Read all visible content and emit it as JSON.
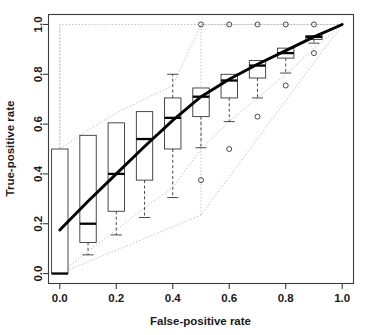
{
  "chart_data": {
    "type": "boxplot",
    "title": "",
    "xlabel": "False-positive rate",
    "ylabel": "True-positive rate",
    "xlim": [
      -0.04,
      1.04
    ],
    "ylim": [
      -0.04,
      1.04
    ],
    "xticks": [
      0.0,
      0.2,
      0.4,
      0.6,
      0.8,
      1.0
    ],
    "xticklabels": [
      "0.0",
      "0.2",
      "0.4",
      "0.6",
      "0.8",
      "1.0"
    ],
    "yticks": [
      0.0,
      0.2,
      0.4,
      0.6,
      0.8,
      1.0
    ],
    "yticklabels": [
      "0.0",
      "0.2",
      "0.4",
      "0.6",
      "0.8",
      "1.0"
    ],
    "grid": false,
    "legend": "none",
    "box_width": 0.058,
    "boxes": [
      {
        "x": 0.0,
        "lower_whisker": 0.0,
        "q1": 0.0,
        "median": 0.0,
        "q3": 0.5,
        "upper_whisker": 0.5,
        "outliers": []
      },
      {
        "x": 0.1,
        "lower_whisker": 0.075,
        "q1": 0.125,
        "median": 0.2,
        "q3": 0.555,
        "upper_whisker": 0.555,
        "outliers": []
      },
      {
        "x": 0.2,
        "lower_whisker": 0.155,
        "q1": 0.25,
        "median": 0.4,
        "q3": 0.605,
        "upper_whisker": 0.605,
        "outliers": []
      },
      {
        "x": 0.3,
        "lower_whisker": 0.225,
        "q1": 0.375,
        "median": 0.54,
        "q3": 0.65,
        "upper_whisker": 0.65,
        "outliers": []
      },
      {
        "x": 0.4,
        "lower_whisker": 0.305,
        "q1": 0.5,
        "median": 0.625,
        "q3": 0.705,
        "upper_whisker": 0.8,
        "outliers": []
      },
      {
        "x": 0.5,
        "lower_whisker": 0.505,
        "q1": 0.63,
        "median": 0.71,
        "q3": 0.745,
        "upper_whisker": 0.745,
        "outliers": [
          0.375,
          1.0
        ]
      },
      {
        "x": 0.6,
        "lower_whisker": 0.61,
        "q1": 0.705,
        "median": 0.775,
        "q3": 0.8,
        "upper_whisker": 0.8,
        "outliers": [
          0.5,
          1.0
        ]
      },
      {
        "x": 0.7,
        "lower_whisker": 0.705,
        "q1": 0.785,
        "median": 0.835,
        "q3": 0.855,
        "upper_whisker": 0.855,
        "outliers": [
          0.63,
          1.0
        ]
      },
      {
        "x": 0.8,
        "lower_whisker": 0.805,
        "q1": 0.865,
        "median": 0.885,
        "q3": 0.905,
        "upper_whisker": 0.905,
        "outliers": [
          0.755,
          1.0
        ]
      },
      {
        "x": 0.9,
        "lower_whisker": 0.925,
        "q1": 0.94,
        "median": 0.95,
        "q3": 0.955,
        "upper_whisker": 0.955,
        "outliers": [
          0.885,
          1.0
        ]
      }
    ],
    "roc_curve": {
      "name": "mean ROC curve",
      "x": [
        0.0,
        0.1,
        0.2,
        0.3,
        0.4,
        0.5,
        0.6,
        0.7,
        0.8,
        0.9,
        1.0
      ],
      "y": [
        0.175,
        0.29,
        0.4,
        0.51,
        0.615,
        0.71,
        0.78,
        0.84,
        0.895,
        0.95,
        1.0
      ]
    },
    "bands": [
      {
        "name": "upper-envelope",
        "x": [
          0.0,
          0.0,
          0.5,
          1.0
        ],
        "y": [
          0.175,
          1.0,
          1.0,
          1.0
        ]
      },
      {
        "name": "upper-inner-envelope",
        "x": [
          0.0,
          0.1,
          0.2,
          0.3,
          0.4,
          0.5,
          0.6,
          0.7,
          0.8,
          0.9,
          1.0
        ],
        "y": [
          0.5,
          0.575,
          0.645,
          0.7,
          0.755,
          1.0,
          1.0,
          1.0,
          1.0,
          1.0,
          1.0
        ]
      },
      {
        "name": "lower-inner-envelope",
        "x": [
          0.0,
          0.1,
          0.2,
          0.3,
          0.4,
          0.5,
          0.6,
          0.7,
          0.8,
          0.9,
          1.0
        ],
        "y": [
          0.0,
          0.09,
          0.175,
          0.265,
          0.345,
          0.5,
          0.61,
          0.705,
          0.8,
          0.905,
          1.0
        ]
      },
      {
        "name": "lower-outer-envelope",
        "x": [
          0.0,
          0.5,
          1.0
        ],
        "y": [
          0.0,
          0.235,
          1.0
        ]
      },
      {
        "name": "vertical-left-edge",
        "x": [
          0.0,
          0.0
        ],
        "y": [
          0.0,
          1.0
        ]
      },
      {
        "name": "vertical-mid-edge",
        "x": [
          0.5,
          0.5
        ],
        "y": [
          0.235,
          1.0
        ]
      }
    ]
  },
  "axes": {
    "x_title": "False-positive rate",
    "y_title": "True-positive rate"
  },
  "colors": {
    "background": "#ffffff",
    "frame": "#3c3c3c",
    "box_stroke": "#2a2a2a",
    "median": "#000000",
    "curve": "#000000",
    "band": "#b4b0ac",
    "text": "#1a1a1a"
  }
}
